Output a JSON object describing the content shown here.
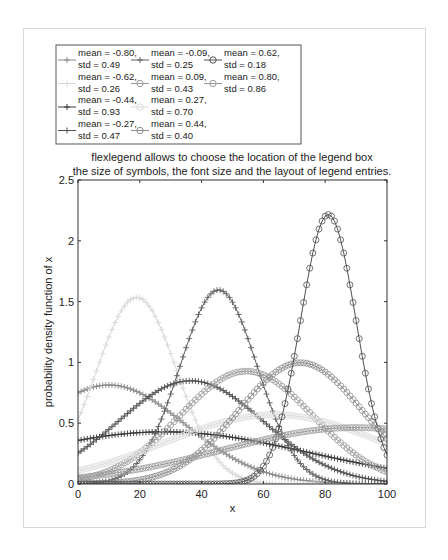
{
  "chart_data": {
    "type": "line",
    "title": [
      "flexlegend allows to choose the location of the legend box",
      "the size of symbols, the font size and the layout of legend entries."
    ],
    "xlabel": "x",
    "ylabel": "probability density function of x",
    "xlim": [
      0,
      100
    ],
    "ylim": [
      0,
      2.5
    ],
    "xticks": [
      0,
      20,
      40,
      60,
      80,
      100
    ],
    "yticks": [
      0,
      0.5,
      1,
      1.5,
      2,
      2.5
    ],
    "ytick_labels": [
      "0",
      "0.5",
      "1",
      "1.5",
      "2",
      "2.5"
    ],
    "grid": false,
    "legend_position": "outside top-left, 3 columns",
    "series": [
      {
        "name": "mean = -0.80, std = 0.49",
        "mean": -0.8,
        "std": 0.49,
        "marker": "+",
        "color": "#8a8a8a"
      },
      {
        "name": "mean = -0.62, std = 0.26",
        "mean": -0.62,
        "std": 0.26,
        "marker": "+",
        "color": "#d8d8d8"
      },
      {
        "name": "mean = -0.44, std = 0.93",
        "mean": -0.44,
        "std": 0.93,
        "marker": "+",
        "color": "#3a3a3a"
      },
      {
        "name": "mean = -0.27, std = 0.47",
        "mean": -0.27,
        "std": 0.47,
        "marker": "+",
        "color": "#505050"
      },
      {
        "name": "mean = -0.09, std = 0.25",
        "mean": -0.09,
        "std": 0.25,
        "marker": "+",
        "color": "#606060"
      },
      {
        "name": "mean = 0.09, std = 0.43",
        "mean": 0.09,
        "std": 0.43,
        "marker": "o",
        "color": "#9a9a9a"
      },
      {
        "name": "mean = 0.27, std = 0.70",
        "mean": 0.27,
        "std": 0.7,
        "marker": "o",
        "color": "#dcdcdc"
      },
      {
        "name": "mean = 0.44, std = 0.40",
        "mean": 0.44,
        "std": 0.4,
        "marker": "o",
        "color": "#8c8c8c"
      },
      {
        "name": "mean = 0.62, std = 0.18",
        "mean": 0.62,
        "std": 0.18,
        "marker": "o",
        "color": "#505050"
      },
      {
        "name": "mean = 0.80, std = 0.86",
        "mean": 0.8,
        "std": 0.86,
        "marker": "o",
        "color": "#9a9a9a"
      }
    ]
  }
}
